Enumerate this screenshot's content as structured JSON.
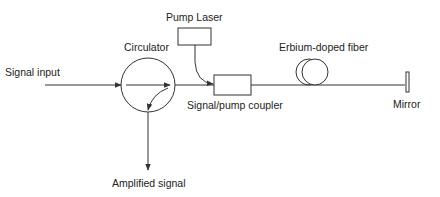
{
  "diagram": {
    "type": "optical amplifier schematic",
    "labels": {
      "signal_input": "Signal input",
      "circulator": "Circulator",
      "pump_laser": "Pump Laser",
      "coupler": "Signal/pump coupler",
      "fiber": "Erbium-doped fiber",
      "mirror": "Mirror",
      "amplified_signal": "Amplified signal"
    },
    "colors": {
      "line": "#333333",
      "text": "#222222",
      "background": "#ffffff"
    }
  }
}
